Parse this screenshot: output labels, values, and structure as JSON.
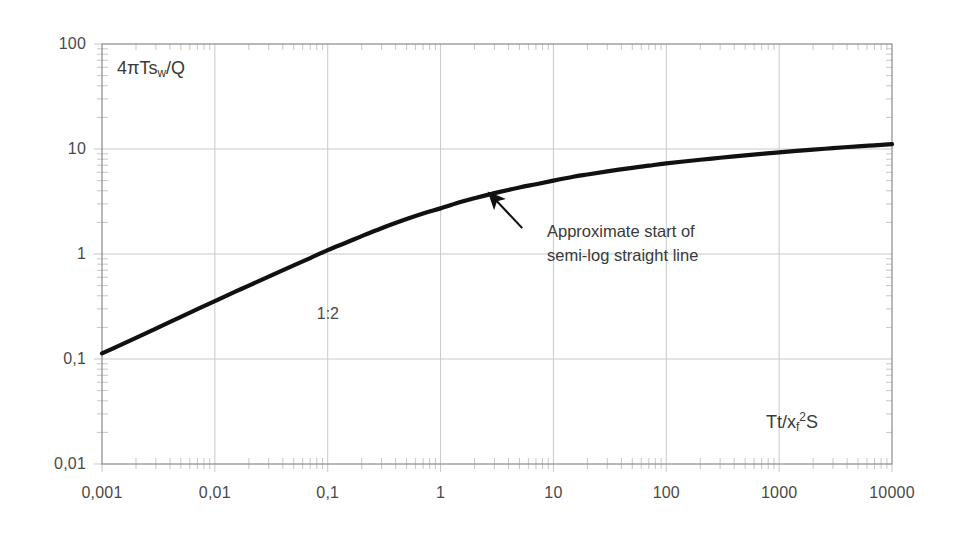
{
  "chart_data": {
    "type": "line",
    "title": "",
    "xlabel": "Tt/xf2S",
    "xlabel_parts": {
      "pre": "Tt/x",
      "sub": "f",
      "sup": "2",
      "post": "S"
    },
    "ylabel": "4πTsw/Q",
    "ylabel_parts": {
      "pre": "4πTs",
      "sub": "w",
      "post": "/Q"
    },
    "xscale": "log",
    "yscale": "log",
    "xlim": [
      0.001,
      10000
    ],
    "ylim": [
      0.01,
      100
    ],
    "grid": true,
    "legend": "none",
    "xticks": [
      0.001,
      0.01,
      0.1,
      1,
      10,
      100,
      1000,
      10000
    ],
    "xtick_labels": [
      "0,001",
      "0,01",
      "0,1",
      "1",
      "10",
      "100",
      "1000",
      "10000"
    ],
    "yticks": [
      0.01,
      0.1,
      1,
      10,
      100
    ],
    "ytick_labels": [
      "0,01",
      "0,1",
      "1",
      "10",
      "100"
    ],
    "minor_ticks": true,
    "series": [
      {
        "name": "4πTsw/Q vs Tt/xf2S",
        "color": "#111111",
        "linewidth": 4.2,
        "x": [
          0.001,
          0.0015,
          0.002,
          0.003,
          0.005,
          0.007,
          0.01,
          0.015,
          0.02,
          0.03,
          0.05,
          0.07,
          0.1,
          0.15,
          0.2,
          0.3,
          0.5,
          0.7,
          1,
          1.5,
          2,
          3,
          5,
          7,
          10,
          15,
          20,
          30,
          50,
          70,
          100,
          200,
          300,
          500,
          700,
          1000,
          2000,
          3000,
          5000,
          7000,
          10000
        ],
        "y": [
          0.113,
          0.138,
          0.159,
          0.195,
          0.252,
          0.298,
          0.356,
          0.435,
          0.5,
          0.61,
          0.78,
          0.915,
          1.09,
          1.3,
          1.48,
          1.76,
          2.15,
          2.43,
          2.72,
          3.12,
          3.4,
          3.8,
          4.3,
          4.62,
          5.0,
          5.44,
          5.72,
          6.12,
          6.62,
          6.94,
          7.3,
          7.9,
          8.25,
          8.7,
          8.98,
          9.3,
          9.85,
          10.2,
          10.6,
          10.85,
          11.15
        ]
      }
    ],
    "annotations": [
      {
        "name": "slope-label",
        "text": "1:2",
        "x_data": 0.08,
        "y_data": 0.33
      },
      {
        "name": "semi-log-note",
        "line1": "Approximate start of",
        "line2": "semi-log straight line",
        "arrow_tip_x_data": 2.7,
        "arrow_tip_y_data": 3.8
      }
    ]
  },
  "axis_labels": {
    "y_title": "4πTs_w/Q",
    "x_title": "Tt/x_f^2S"
  }
}
